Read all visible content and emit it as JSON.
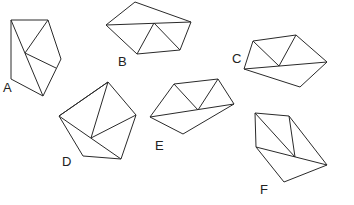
{
  "diagram": {
    "stroke_color": "#2a2a2a",
    "shapes": [
      {
        "label": "A",
        "label_pos": [
          3,
          92
        ],
        "outline": [
          [
            11,
            20
          ],
          [
            48,
            20
          ],
          [
            61,
            59
          ],
          [
            43,
            96
          ],
          [
            11,
            79
          ]
        ],
        "diagonals": [
          [
            [
              25,
              53
            ],
            [
              48,
              20
            ]
          ],
          [
            [
              25,
              53
            ],
            [
              56,
              68
            ]
          ],
          [
            [
              11,
              20
            ],
            [
              43,
              96
            ]
          ]
        ]
      },
      {
        "label": "B",
        "label_pos": [
          118,
          66
        ],
        "outline": [
          [
            135,
            2
          ],
          [
            191,
            22
          ],
          [
            180,
            50
          ],
          [
            137,
            54
          ],
          [
            106,
            25
          ]
        ],
        "diagonals": [
          [
            [
              106,
              25
            ],
            [
              191,
              22
            ]
          ],
          [
            [
              154,
              23
            ],
            [
              137,
              54
            ]
          ],
          [
            [
              154,
              23
            ],
            [
              180,
              50
            ]
          ]
        ]
      },
      {
        "label": "C",
        "label_pos": [
          232,
          63
        ],
        "outline": [
          [
            253,
            41
          ],
          [
            296,
            35
          ],
          [
            327,
            62
          ],
          [
            300,
            87
          ],
          [
            244,
            69
          ]
        ],
        "diagonals": [
          [
            [
              244,
              69
            ],
            [
              327,
              62
            ]
          ],
          [
            [
              253,
              41
            ],
            [
              279,
              66
            ]
          ],
          [
            [
              296,
              35
            ],
            [
              279,
              66
            ]
          ]
        ]
      },
      {
        "label": "D",
        "label_pos": [
          62,
          166
        ],
        "outline": [
          [
            108,
            82
          ],
          [
            136,
            115
          ],
          [
            121,
            159
          ],
          [
            83,
            156
          ],
          [
            59,
            116
          ]
        ],
        "diagonals": [
          [
            [
              59,
              116
            ],
            [
              108,
              82
            ]
          ],
          [
            [
              108,
              82
            ],
            [
              91,
              138
            ]
          ],
          [
            [
              91,
              138
            ],
            [
              136,
              115
            ]
          ],
          [
            [
              59,
              116
            ],
            [
              121,
              159
            ]
          ]
        ]
      },
      {
        "label": "E",
        "label_pos": [
          155,
          150
        ],
        "outline": [
          [
            174,
            84
          ],
          [
            218,
            79
          ],
          [
            234,
            104
          ],
          [
            183,
            134
          ],
          [
            150,
            117
          ]
        ],
        "diagonals": [
          [
            [
              150,
              117
            ],
            [
              234,
              104
            ]
          ],
          [
            [
              174,
              84
            ],
            [
              198,
              110
            ]
          ],
          [
            [
              218,
              79
            ],
            [
              198,
              110
            ]
          ]
        ]
      },
      {
        "label": "F",
        "label_pos": [
          260,
          194
        ],
        "outline": [
          [
            255,
            113
          ],
          [
            289,
            116
          ],
          [
            327,
            165
          ],
          [
            284,
            182
          ],
          [
            256,
            147
          ]
        ],
        "diagonals": [
          [
            [
              256,
              147
            ],
            [
              327,
              165
            ]
          ],
          [
            [
              255,
              113
            ],
            [
              295,
              157
            ]
          ],
          [
            [
              289,
              116
            ],
            [
              295,
              157
            ]
          ]
        ]
      }
    ]
  }
}
